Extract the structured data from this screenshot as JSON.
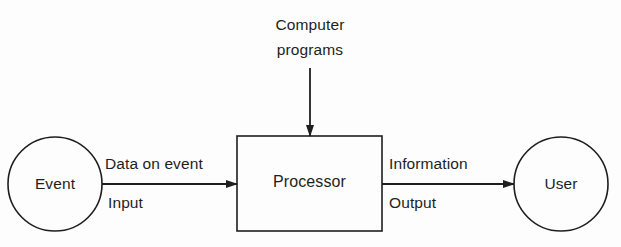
{
  "diagram": {
    "nodes": {
      "event": {
        "label": "Event",
        "shape": "circle"
      },
      "processor": {
        "label": "Processor",
        "shape": "rectangle"
      },
      "user": {
        "label": "User",
        "shape": "circle"
      },
      "programs": {
        "label_line1": "Computer",
        "label_line2": "programs",
        "shape": "text"
      }
    },
    "edges": {
      "event_to_processor": {
        "from": "Event",
        "to": "Processor",
        "label_above": "Data on event",
        "label_below": "Input"
      },
      "processor_to_user": {
        "from": "Processor",
        "to": "User",
        "label_above": "Information",
        "label_below": "Output"
      },
      "programs_to_processor": {
        "from": "Computer programs",
        "to": "Processor"
      }
    },
    "colors": {
      "stroke": "#1e1e1e",
      "background": "#fdfdfd"
    }
  }
}
